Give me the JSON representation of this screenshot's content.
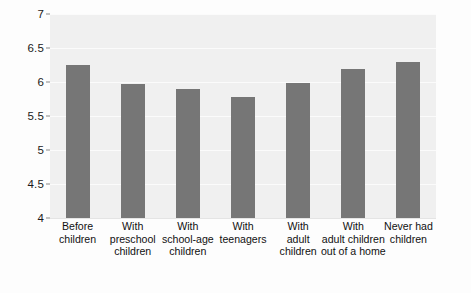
{
  "chart_data": {
    "type": "bar",
    "title": "",
    "subtitle": "",
    "xlabel": "",
    "ylabel": "",
    "categories": [
      "Before children",
      "With preschool children",
      "With school-age children",
      "With teenagers",
      "With adult children",
      "With adult children out of a home",
      "Never had children"
    ],
    "category_lines": [
      [
        "Before",
        "children"
      ],
      [
        "With",
        "preschool",
        "children"
      ],
      [
        "With",
        "school-age",
        "children"
      ],
      [
        "With",
        "teenagers"
      ],
      [
        "With",
        "adult",
        "children"
      ],
      [
        "With",
        "adult children",
        "out of a home"
      ],
      [
        "Never had",
        "children"
      ]
    ],
    "values": [
      6.25,
      5.97,
      5.9,
      5.78,
      5.99,
      6.19,
      6.3
    ],
    "ylim": [
      4,
      7
    ],
    "yticks": [
      4,
      4.5,
      5,
      5.5,
      6,
      6.5,
      7
    ],
    "ytick_labels": [
      "4",
      "4.5",
      "5",
      "5.5",
      "6",
      "6.5",
      "7"
    ],
    "grid": true,
    "legend": false,
    "legend_position": "none",
    "colors": {
      "bar": "#767676",
      "plot_background": "#f0f0f0",
      "gridline": "#fbfbfb",
      "page_background": "#fdfdfd",
      "text": "#111111"
    }
  }
}
